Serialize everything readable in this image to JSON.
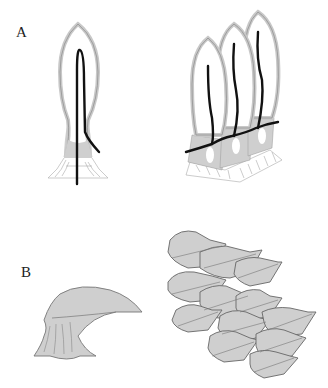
{
  "figure": {
    "panels": [
      {
        "label": "A",
        "description": "Single papilla with central dark line (left) and row of three papillae connected by dark line (right)"
      },
      {
        "label": "B",
        "description": "Single hooked scale (left) and overlapping array of scales (right)"
      }
    ]
  },
  "colors": {
    "fill_gray": "#cfcfcf",
    "outline_gray": "#9a9a9a",
    "dark_line": "#111111",
    "background": "#ffffff"
  }
}
